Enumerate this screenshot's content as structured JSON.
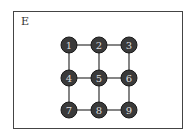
{
  "panel": {
    "label": "E"
  },
  "graph": {
    "nodes": [
      {
        "id": "1",
        "x": 69,
        "y": 45
      },
      {
        "id": "2",
        "x": 99,
        "y": 45
      },
      {
        "id": "3",
        "x": 129,
        "y": 45
      },
      {
        "id": "4",
        "x": 69,
        "y": 78
      },
      {
        "id": "5",
        "x": 99,
        "y": 78
      },
      {
        "id": "6",
        "x": 129,
        "y": 78
      },
      {
        "id": "7",
        "x": 69,
        "y": 110
      },
      {
        "id": "8",
        "x": 99,
        "y": 110
      },
      {
        "id": "9",
        "x": 129,
        "y": 110
      }
    ],
    "edges": [
      [
        "1",
        "2"
      ],
      [
        "2",
        "3"
      ],
      [
        "1",
        "4"
      ],
      [
        "2",
        "5"
      ],
      [
        "3",
        "6"
      ],
      [
        "4",
        "5"
      ],
      [
        "5",
        "6"
      ],
      [
        "4",
        "7"
      ],
      [
        "5",
        "8"
      ],
      [
        "6",
        "9"
      ],
      [
        "7",
        "8"
      ],
      [
        "8",
        "9"
      ]
    ],
    "node_fill": "#3a3a3a",
    "node_stroke": "#1a1a1a",
    "edge_color": "#333333"
  }
}
